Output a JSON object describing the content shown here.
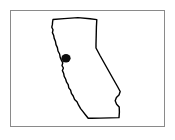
{
  "figure": {
    "kind": "map-outline-diagram",
    "title_text": "",
    "caption_text": "",
    "labels": [],
    "annotations": []
  },
  "canvas": {
    "width": 175,
    "height": 140,
    "background_color": "#ffffff"
  },
  "frame": {
    "name": "figure-border",
    "x": 10,
    "y": 10,
    "width": 155,
    "height": 117,
    "stroke_color": "#8a8a8a",
    "stroke_width": 1,
    "fill_color": "#ffffff"
  },
  "map_data": {
    "type": "outline",
    "region_name": "California",
    "outline": {
      "stroke_color": "#000000",
      "fill_color": "#ffffff",
      "stroke_width": 1.4,
      "points": [
        [
          53.0,
          19.5
        ],
        [
          64.0,
          18.6
        ],
        [
          78.0,
          17.6
        ],
        [
          90.0,
          18.8
        ],
        [
          96.8,
          19.6
        ],
        [
          96.4,
          27.0
        ],
        [
          96.2,
          36.0
        ],
        [
          96.0,
          44.0
        ],
        [
          96.0,
          48.0
        ],
        [
          100.0,
          55.5
        ],
        [
          104.5,
          63.5
        ],
        [
          109.0,
          71.5
        ],
        [
          113.5,
          79.5
        ],
        [
          117.5,
          86.5
        ],
        [
          120.2,
          91.5
        ],
        [
          119.0,
          95.0
        ],
        [
          116.4,
          97.6
        ],
        [
          115.2,
          100.8
        ],
        [
          116.6,
          104.2
        ],
        [
          119.2,
          107.0
        ],
        [
          119.4,
          112.0
        ],
        [
          119.0,
          117.6
        ],
        [
          110.0,
          117.9
        ],
        [
          100.0,
          118.1
        ],
        [
          92.0,
          118.2
        ],
        [
          88.2,
          118.3
        ],
        [
          85.6,
          115.0
        ],
        [
          83.0,
          111.6
        ],
        [
          80.6,
          108.6
        ],
        [
          78.6,
          105.2
        ],
        [
          77.0,
          101.8
        ],
        [
          74.6,
          99.4
        ],
        [
          73.2,
          96.0
        ],
        [
          71.4,
          93.4
        ],
        [
          70.6,
          90.2
        ],
        [
          68.8,
          87.8
        ],
        [
          68.2,
          84.6
        ],
        [
          66.6,
          82.2
        ],
        [
          65.6,
          79.0
        ],
        [
          64.2,
          76.4
        ],
        [
          63.6,
          73.2
        ],
        [
          62.4,
          70.6
        ],
        [
          63.4,
          68.0
        ],
        [
          62.0,
          65.6
        ],
        [
          62.8,
          62.8
        ],
        [
          61.4,
          60.2
        ],
        [
          60.2,
          57.4
        ],
        [
          59.6,
          54.0
        ],
        [
          58.0,
          51.0
        ],
        [
          57.4,
          47.6
        ],
        [
          56.0,
          44.6
        ],
        [
          55.4,
          41.2
        ],
        [
          54.2,
          38.4
        ],
        [
          53.6,
          35.2
        ],
        [
          52.4,
          32.6
        ],
        [
          53.0,
          29.8
        ],
        [
          51.8,
          27.2
        ],
        [
          52.4,
          24.4
        ],
        [
          52.6,
          21.8
        ]
      ]
    },
    "markers": [
      {
        "name": "location-marker",
        "label": "",
        "shape": "circle",
        "cx": 66.0,
        "cy": 58.2,
        "rx": 4.6,
        "ry": 4.2,
        "color": "#0d0d0d"
      }
    ]
  }
}
